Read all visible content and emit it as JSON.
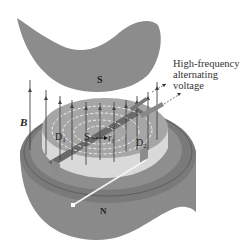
{
  "diagram": {
    "labels": {
      "south_pole": "S",
      "north_pole": "N",
      "magnetic_field": "B",
      "dee_1": "D",
      "dee_1_sub": "1",
      "dee_2": "D",
      "dee_2_sub": "2",
      "source": "S",
      "radius": "r",
      "radius_sub": "1"
    },
    "caption_lines": [
      "High-frequency",
      "alternating",
      "voltage"
    ],
    "colors": {
      "magnet": "#8a8a8a",
      "magnet_dark": "#6e6e6e",
      "dee_top": "#a9a9a9",
      "dee_wall": "#d8d8d8",
      "field_lines": "#4a4a4a",
      "path": "#f0f0f0",
      "background": "#ffffff"
    }
  }
}
